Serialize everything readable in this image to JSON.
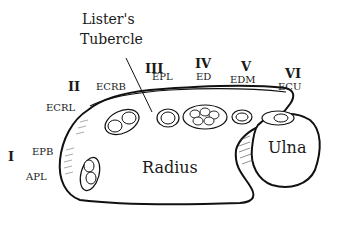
{
  "diagram": {
    "title_label": "Lister's",
    "title_label_2": "Tubercle",
    "bones": {
      "radius": "Radius",
      "ulna": "Ulna"
    },
    "compartments": [
      {
        "numeral": "I",
        "tendons": [
          "EPB",
          "APL"
        ]
      },
      {
        "numeral": "II",
        "tendons": [
          "ECRL",
          "ECRB"
        ]
      },
      {
        "numeral": "III",
        "tendons": [
          "EPL"
        ]
      },
      {
        "numeral": "IV",
        "tendons": [
          "ED"
        ]
      },
      {
        "numeral": "V",
        "tendons": [
          "EDM"
        ]
      },
      {
        "numeral": "VI",
        "tendons": [
          "ECU"
        ]
      }
    ],
    "colors": {
      "line": "#111111",
      "fill": "#ffffff"
    }
  }
}
